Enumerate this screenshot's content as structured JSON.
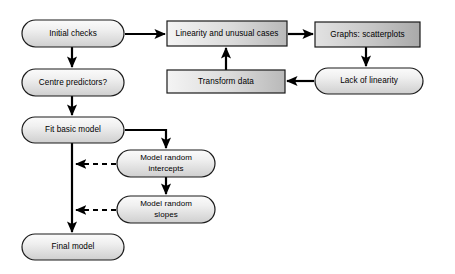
{
  "diagram": {
    "background_color": "#ffffff",
    "line_color": "#000000",
    "node_fill_light": "#f2f2f2",
    "node_fill_dark": "#b4b4b4",
    "node_border_color": "#1a1a1a",
    "nodes": [
      {
        "id": "initial-checks",
        "label": "Initial checks",
        "shape": "stadium",
        "x": 22,
        "y": 20,
        "w": 102,
        "h": 27
      },
      {
        "id": "centre-predictors",
        "label": "Centre predictors?",
        "shape": "stadium",
        "x": 22,
        "y": 69,
        "w": 102,
        "h": 27
      },
      {
        "id": "fit-basic-model",
        "label": "Fit basic model",
        "shape": "stadium",
        "x": 22,
        "y": 117,
        "w": 102,
        "h": 26
      },
      {
        "id": "final-model",
        "label": "Final model",
        "shape": "stadium",
        "x": 22,
        "y": 234,
        "w": 102,
        "h": 26
      },
      {
        "id": "model-random-intercepts",
        "label": "Model random intercepts",
        "label_lines": [
          "Model random",
          "intercepts"
        ],
        "shape": "stadium",
        "x": 117,
        "y": 150,
        "w": 98,
        "h": 27
      },
      {
        "id": "model-random-slopes",
        "label": "Model random slopes",
        "label_lines": [
          "Model random",
          "slopes"
        ],
        "shape": "stadium",
        "x": 117,
        "y": 196,
        "w": 98,
        "h": 27
      },
      {
        "id": "linearity-unusual-cases",
        "label": "Linearity and unusual cases",
        "shape": "rect",
        "x": 167,
        "y": 21,
        "w": 120,
        "h": 25
      },
      {
        "id": "graphs-scatterplots",
        "label": "Graphs: scatterplots",
        "shape": "rect",
        "x": 315,
        "y": 22,
        "w": 105,
        "h": 25
      },
      {
        "id": "transform-data",
        "label": "Transform data",
        "shape": "rect",
        "x": 167,
        "y": 70,
        "w": 118,
        "h": 23
      },
      {
        "id": "lack-of-linearity",
        "label": "Lack of linearity",
        "shape": "stadium",
        "x": 315,
        "y": 68,
        "w": 108,
        "h": 26
      }
    ],
    "connectors": [
      {
        "id": "initial-to-linearity",
        "from": "initial-checks",
        "to": "linearity-unusual-cases",
        "style": "solid",
        "direction": "right"
      },
      {
        "id": "initial-to-centre",
        "from": "initial-checks",
        "to": "centre-predictors",
        "style": "solid",
        "direction": "down"
      },
      {
        "id": "centre-to-fit",
        "from": "centre-predictors",
        "to": "fit-basic-model",
        "style": "solid",
        "direction": "down"
      },
      {
        "id": "linearity-to-graphs",
        "from": "linearity-unusual-cases",
        "to": "graphs-scatterplots",
        "style": "solid",
        "direction": "right"
      },
      {
        "id": "graphs-to-lack",
        "from": "graphs-scatterplots",
        "to": "lack-of-linearity",
        "style": "solid",
        "direction": "down"
      },
      {
        "id": "lack-to-transform",
        "from": "lack-of-linearity",
        "to": "transform-data",
        "style": "solid",
        "direction": "left"
      },
      {
        "id": "transform-to-linearity",
        "from": "transform-data",
        "to": "linearity-unusual-cases",
        "style": "solid",
        "direction": "up"
      },
      {
        "id": "fit-to-intercepts",
        "from": "fit-basic-model",
        "to": "model-random-intercepts",
        "style": "solid",
        "direction": "down-right"
      },
      {
        "id": "intercepts-to-slopes",
        "from": "model-random-intercepts",
        "to": "model-random-slopes",
        "style": "solid",
        "direction": "down"
      },
      {
        "id": "intercepts-to-spine",
        "from": "model-random-intercepts",
        "to": "fit-basic-model",
        "style": "dashed",
        "direction": "left"
      },
      {
        "id": "slopes-to-spine",
        "from": "model-random-slopes",
        "to": "fit-basic-model",
        "style": "dashed",
        "direction": "left"
      },
      {
        "id": "fit-to-final",
        "from": "fit-basic-model",
        "to": "final-model",
        "style": "solid",
        "direction": "down"
      }
    ]
  }
}
